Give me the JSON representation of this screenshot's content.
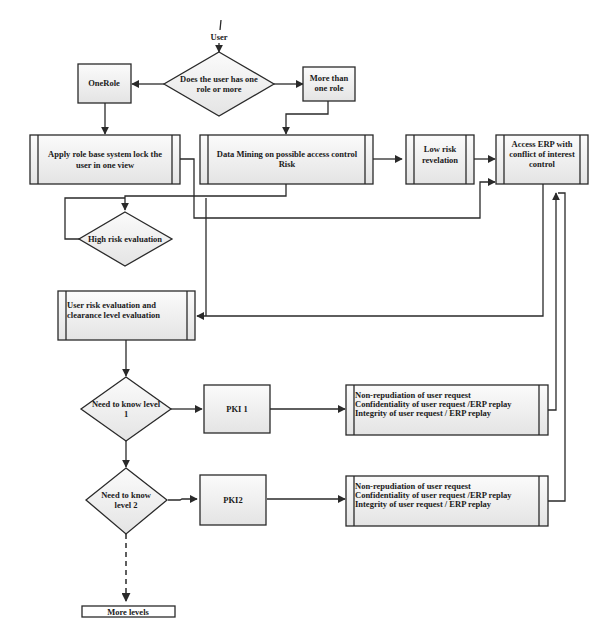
{
  "diagram": {
    "type": "flowchart",
    "nodes": {
      "start": {
        "label": "User"
      },
      "decision_roles": {
        "line1": "Does the user has one",
        "line2": "role or more"
      },
      "one_role": {
        "label": "OneRole"
      },
      "more_roles": {
        "line1": "More than",
        "line2": "one role"
      },
      "apply_role_lock": {
        "line1": "Apply role base system lock the",
        "line2": "user in one view"
      },
      "data_mining": {
        "line1": "Data Mining on possible  access control",
        "line2": "Risk"
      },
      "low_risk": {
        "line1": "Low risk",
        "line2": "revelation"
      },
      "access_erp": {
        "line1": "Access ERP  with",
        "line2": "conflict of interest",
        "line3": "control"
      },
      "high_risk": {
        "label": "High risk evaluation"
      },
      "user_risk_eval": {
        "line1": "User risk evaluation and",
        "line2": "clearance level evaluation"
      },
      "need_level1": {
        "line1": "Need to know level",
        "line2": "1"
      },
      "pki1": {
        "label": "PKI 1"
      },
      "security_1": {
        "line1": "Non-repudiation of user request",
        "line2": "Confidentiality of  user request /ERP replay",
        "line3": "Integrity of user request / ERP replay"
      },
      "need_level2": {
        "line1": "Need to know",
        "line2": "level 2"
      },
      "pki2": {
        "label": "PKI2"
      },
      "security_2": {
        "line1": "Non-repudiation of user request",
        "line2": "Confidentiality of  user request /ERP replay",
        "line3": "Integrity of user request / ERP replay"
      },
      "more_levels": {
        "label": "More levels"
      }
    },
    "edges": [
      {
        "from": "start",
        "to": "decision_roles"
      },
      {
        "from": "decision_roles",
        "to": "one_role"
      },
      {
        "from": "decision_roles",
        "to": "more_roles"
      },
      {
        "from": "one_role",
        "to": "apply_role_lock"
      },
      {
        "from": "more_roles",
        "to": "data_mining"
      },
      {
        "from": "data_mining",
        "to": "low_risk"
      },
      {
        "from": "low_risk",
        "to": "access_erp"
      },
      {
        "from": "apply_role_lock",
        "to": "access_erp"
      },
      {
        "from": "data_mining",
        "to": "high_risk"
      },
      {
        "from": "high_risk",
        "to": "high_risk",
        "note": "loop"
      },
      {
        "from": "access_erp",
        "to": "user_risk_eval"
      },
      {
        "from": "user_risk_eval",
        "to": "need_level1"
      },
      {
        "from": "need_level1",
        "to": "pki1"
      },
      {
        "from": "pki1",
        "to": "security_1"
      },
      {
        "from": "security_1",
        "to": "access_erp"
      },
      {
        "from": "need_level1",
        "to": "need_level2"
      },
      {
        "from": "need_level2",
        "to": "pki2"
      },
      {
        "from": "pki2",
        "to": "security_2"
      },
      {
        "from": "security_2",
        "to": "access_erp"
      },
      {
        "from": "need_level2",
        "to": "more_levels",
        "style": "dashed"
      }
    ],
    "colors": {
      "stroke": "#2a2a2a",
      "fill_top": "#fafafa",
      "fill_bottom": "#e6e6e6",
      "text": "#1a1a1a"
    }
  }
}
